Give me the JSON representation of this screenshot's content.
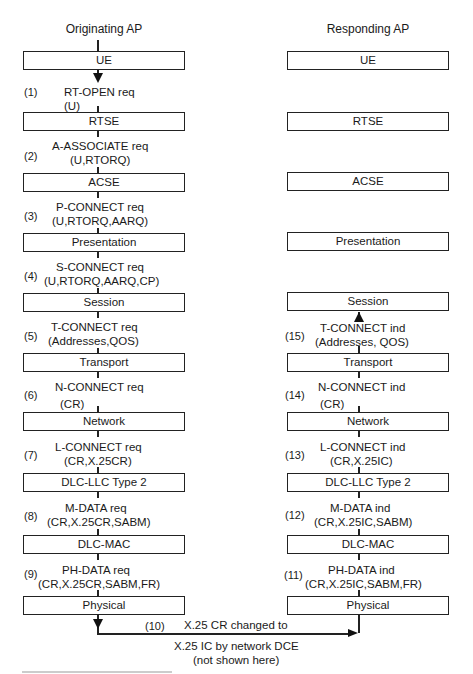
{
  "headers": {
    "left": "Originating AP",
    "right": "Responding AP"
  },
  "layers": [
    "UE",
    "RTSE",
    "ACSE",
    "Presentation",
    "Session",
    "Transport",
    "Network",
    "DLC-LLC Type 2",
    "DLC-MAC",
    "Physical"
  ],
  "left_messages": [
    {
      "num": "(1)",
      "line1": "RT-OPEN req",
      "line2": "(U)"
    },
    {
      "num": "(2)",
      "line1": "A-ASSOCIATE req",
      "line2": "(U,RTORQ)"
    },
    {
      "num": "(3)",
      "line1": "P-CONNECT req",
      "line2": "(U,RTORQ,AARQ)"
    },
    {
      "num": "(4)",
      "line1": "S-CONNECT req",
      "line2": "(U,RTORQ,AARQ,CP)"
    },
    {
      "num": "(5)",
      "line1": "T-CONNECT req",
      "line2": "(Addresses,QOS)"
    },
    {
      "num": "(6)",
      "line1": "N-CONNECT req",
      "line2": "(CR)"
    },
    {
      "num": "(7)",
      "line1": "L-CONNECT req",
      "line2": "(CR,X.25CR)"
    },
    {
      "num": "(8)",
      "line1": "M-DATA req",
      "line2": "(CR,X.25CR,SABM)"
    },
    {
      "num": "(9)",
      "line1": "PH-DATA req",
      "line2": "(CR,X.25CR,SABM,FR)"
    }
  ],
  "right_messages": [
    {
      "num": "(15)",
      "line1": "T-CONNECT ind",
      "line2": "(Addresses, QOS)"
    },
    {
      "num": "(14)",
      "line1": "N-CONNECT ind",
      "line2": "(CR)"
    },
    {
      "num": "(13)",
      "line1": "L-CONNECT ind",
      "line2": "(CR,X.25IC)"
    },
    {
      "num": "(12)",
      "line1": "M-DATA ind",
      "line2": "(CR,X.25IC,SABM)"
    },
    {
      "num": "(11)",
      "line1": "PH-DATA ind",
      "line2": "(CR,X.25IC,SABM,FR)"
    }
  ],
  "network_step": {
    "num": "(10)",
    "line1": "X.25 CR changed to",
    "line2": "X.25 IC by network DCE",
    "line3": "(not shown here)"
  }
}
